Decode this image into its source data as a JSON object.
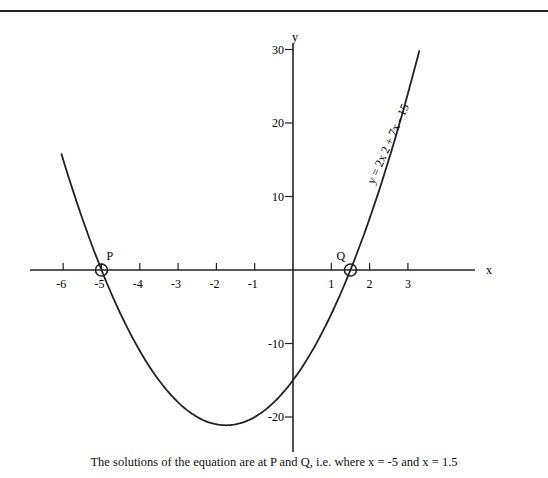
{
  "caption": "The solutions of the equation are at P and Q, i.e. where x = -5 and x = 1.5",
  "chart_data": {
    "type": "line",
    "title": "",
    "equation_label": "y = 2x 2 + 7x - 15",
    "xlabel": "x",
    "ylabel": "y",
    "x_ticks": [
      -6,
      -5,
      -4,
      -3,
      -2,
      -1,
      1,
      2,
      3
    ],
    "y_ticks": [
      30,
      20,
      10,
      -10,
      -20
    ],
    "xlim": [
      -6.2,
      4.8
    ],
    "ylim": [
      -25,
      31
    ],
    "grid": false,
    "series": [
      {
        "name": "y = 2x^2 + 7x - 15",
        "x": [
          -6,
          -5,
          -4,
          -3,
          -2,
          -1.75,
          -1,
          0,
          1,
          1.5,
          2,
          3,
          3.3
        ],
        "y": [
          15,
          0,
          -11,
          -18,
          -21,
          -21.1,
          -20,
          -15,
          -6,
          0,
          7,
          24,
          28
        ]
      }
    ],
    "annotations": [
      {
        "label": "P",
        "x": -5,
        "y": 0
      },
      {
        "label": "Q",
        "x": 1.5,
        "y": 0
      }
    ]
  }
}
